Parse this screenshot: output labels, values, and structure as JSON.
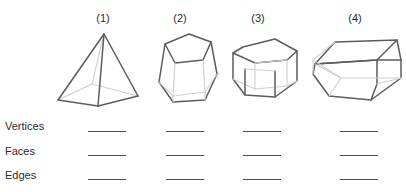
{
  "worksheet": {
    "title": "Vertices, Faces and Edges of Solid Figures",
    "background_color": "#ffffff",
    "line_color": "#4a4a4a",
    "edge_color": "#5c5c5c",
    "hidden_edge_color": "#cfcfcf",
    "text_color": "#2b2b2b"
  },
  "columns": [
    {
      "header": "(1)",
      "figure_name": "square-pyramid"
    },
    {
      "header": "(2)",
      "figure_name": "pentagonal-prism-upright"
    },
    {
      "header": "(3)",
      "figure_name": "hexagonal-prism"
    },
    {
      "header": "(4)",
      "figure_name": "pentagonal-prism-horizontal"
    }
  ],
  "rows": [
    {
      "label": "Vertices"
    },
    {
      "label": "Faces"
    },
    {
      "label": "Edges"
    }
  ],
  "answers": {
    "vertices": [
      "",
      "",
      "",
      ""
    ],
    "faces": [
      "",
      "",
      "",
      ""
    ],
    "edges": [
      "",
      "",
      "",
      ""
    ]
  }
}
